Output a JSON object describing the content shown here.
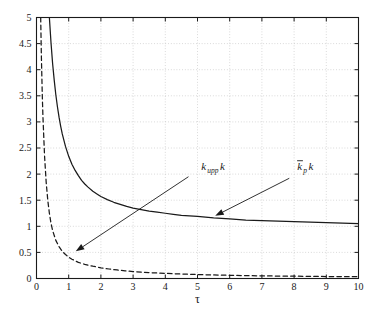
{
  "chart_data": {
    "type": "line",
    "title": "",
    "xlabel": "τ",
    "ylabel": "",
    "xlim": [
      0,
      10
    ],
    "ylim": [
      0,
      5
    ],
    "grid": true,
    "grid_style": "dotted",
    "legend_position": "inline-annotations",
    "background": "#ffffff",
    "line_color": "#1a1a1a",
    "xticks": [
      0,
      1,
      2,
      3,
      4,
      5,
      6,
      7,
      8,
      9,
      10
    ],
    "xtick_labels": [
      "0",
      "1",
      "2",
      "3",
      "4",
      "5",
      "6",
      "7",
      "8",
      "9",
      "10"
    ],
    "yticks": [
      0,
      0.5,
      1,
      1.5,
      2,
      2.5,
      3,
      3.5,
      4,
      4.5,
      5
    ],
    "ytick_labels": [
      "0",
      "0.5",
      "1",
      "1.5",
      "2",
      "2.5",
      "3",
      "3.5",
      "4",
      "4.5",
      "5"
    ],
    "series": [
      {
        "name": "k_upp k",
        "style": "solid",
        "label_text": "k",
        "label_sub": "upp",
        "label_tail": "k",
        "x": [
          0.4,
          0.45,
          0.5,
          0.55,
          0.6,
          0.65,
          0.7,
          0.75,
          0.8,
          0.9,
          1.0,
          1.1,
          1.2,
          1.3,
          1.4,
          1.5,
          1.6,
          1.75,
          1.9,
          2.0,
          2.2,
          2.4,
          2.6,
          2.8,
          3.0,
          3.25,
          3.5,
          3.75,
          4.0,
          4.25,
          4.5,
          4.75,
          5.0,
          5.5,
          6.0,
          6.5,
          7.0,
          7.5,
          8.0,
          8.5,
          9.0,
          9.5,
          10.0
        ],
        "y": [
          5.0,
          4.52,
          4.12,
          3.8,
          3.52,
          3.29,
          3.09,
          2.92,
          2.77,
          2.53,
          2.34,
          2.19,
          2.07,
          1.97,
          1.88,
          1.81,
          1.75,
          1.67,
          1.61,
          1.57,
          1.51,
          1.46,
          1.42,
          1.38,
          1.35,
          1.32,
          1.29,
          1.27,
          1.25,
          1.23,
          1.21,
          1.2,
          1.19,
          1.16,
          1.14,
          1.12,
          1.11,
          1.1,
          1.09,
          1.08,
          1.07,
          1.06,
          1.05
        ]
      },
      {
        "name": "kbar_p k",
        "style": "dashed",
        "label_text": "k",
        "label_sub": "p",
        "label_tail": "k",
        "label_overbar": true,
        "x": [
          0.13,
          0.15,
          0.18,
          0.2,
          0.25,
          0.3,
          0.35,
          0.4,
          0.45,
          0.5,
          0.6,
          0.7,
          0.8,
          0.9,
          1.0,
          1.1,
          1.2,
          1.3,
          1.4,
          1.5,
          1.75,
          2.0,
          2.25,
          2.5,
          2.75,
          3.0,
          3.25,
          3.5,
          3.75,
          4.0,
          4.5,
          5.0,
          5.5,
          6.0,
          6.5,
          7.0,
          7.5,
          8.0,
          8.5,
          9.0,
          9.5,
          10.0
        ],
        "y": [
          5.0,
          4.3,
          3.5,
          3.1,
          2.35,
          1.85,
          1.5,
          1.25,
          1.06,
          0.92,
          0.73,
          0.61,
          0.52,
          0.46,
          0.41,
          0.37,
          0.34,
          0.31,
          0.29,
          0.27,
          0.235,
          0.205,
          0.182,
          0.163,
          0.147,
          0.134,
          0.123,
          0.113,
          0.105,
          0.098,
          0.086,
          0.076,
          0.068,
          0.061,
          0.056,
          0.051,
          0.047,
          0.044,
          0.041,
          0.038,
          0.036,
          0.034
        ]
      }
    ],
    "annotations": [
      {
        "name": "kbar-p-k-annotation",
        "label": "k̄_p k",
        "text_x": 5.12,
        "text_y": 2.08,
        "arrow_from_x": 4.72,
        "arrow_from_y": 1.95,
        "arrow_to_x": 1.22,
        "arrow_to_y": 0.52
      },
      {
        "name": "k-upp-k-annotation",
        "label": "k_upp k",
        "text_x": 8.1,
        "text_y": 2.08,
        "arrow_from_x": 7.85,
        "arrow_from_y": 1.92,
        "arrow_to_x": 5.55,
        "arrow_to_y": 1.2
      }
    ]
  }
}
